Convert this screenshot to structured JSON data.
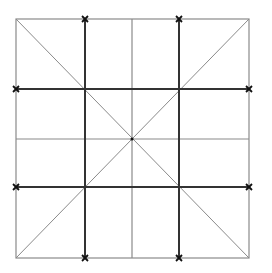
{
  "diagram": {
    "type": "square-grid-with-diagonals",
    "bounds": {
      "x1": 16,
      "y1": 19,
      "x2": 249,
      "y2": 258
    },
    "center": {
      "x": 132,
      "y": 139
    },
    "colors": {
      "thick": "#333333",
      "thin": "#8a8a8a",
      "diagonal": "#8a8a8a",
      "marker": "#111111"
    },
    "thick_verticals": [
      85,
      179
    ],
    "thick_horizontals": [
      89,
      187
    ],
    "thin_verticals": [
      132
    ],
    "thin_horizontals": [
      139
    ],
    "markers": [
      {
        "x": 85,
        "y": 19
      },
      {
        "x": 179,
        "y": 19
      },
      {
        "x": 16,
        "y": 89
      },
      {
        "x": 249,
        "y": 89
      },
      {
        "x": 16,
        "y": 187
      },
      {
        "x": 249,
        "y": 187
      },
      {
        "x": 85,
        "y": 258
      },
      {
        "x": 179,
        "y": 258
      }
    ]
  }
}
